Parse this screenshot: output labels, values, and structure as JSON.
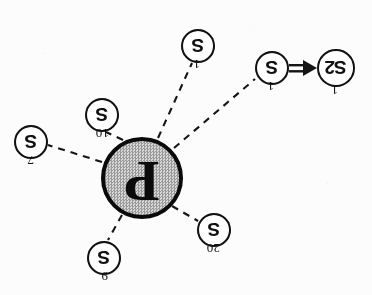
{
  "figure": {
    "orientation_degrees": 180,
    "background_color": "#fcfcfc",
    "ink_color": "#111111",
    "center_fill_color": "#c9c9c9"
  },
  "center_node": {
    "label": "P",
    "name": "center-node-p",
    "x": 230,
    "y": 117,
    "radius": 41
  },
  "nodes": [
    {
      "id": "s-20",
      "label": "S",
      "tag": "20",
      "x": 158,
      "y": 65,
      "radius": 17,
      "tag_dx": -6,
      "tag_dy": -26
    },
    {
      "id": "s-9",
      "label": "S",
      "tag": "9",
      "x": 268,
      "y": 37,
      "radius": 17,
      "tag_dx": -4,
      "tag_dy": -26
    },
    {
      "id": "s-7",
      "label": "S",
      "tag": "7",
      "x": 341,
      "y": 153,
      "radius": 17,
      "tag_dx": -3,
      "tag_dy": -26
    },
    {
      "id": "s-10",
      "label": "S",
      "tag": "10",
      "x": 270,
      "y": 180,
      "radius": 17,
      "tag_dx": -7,
      "tag_dy": -26
    },
    {
      "id": "s-1-bottom",
      "label": "S",
      "tag": "1",
      "x": 174,
      "y": 249,
      "radius": 17,
      "tag_dx": -2,
      "tag_dy": -26
    },
    {
      "id": "s-1-left",
      "label": "S",
      "tag": "1",
      "x": 100,
      "y": 227,
      "radius": 17,
      "tag_dx": -2,
      "tag_dy": -26
    }
  ],
  "terminal_node": {
    "id": "s2-1",
    "label": "S2",
    "tag": "1",
    "x": 36,
    "y": 227,
    "radius": 19,
    "tag_dx": -2,
    "tag_dy": -28
  },
  "dashed_edges": [
    {
      "from": "center-node-p",
      "to": "s-20"
    },
    {
      "from": "center-node-p",
      "to": "s-9"
    },
    {
      "from": "center-node-p",
      "to": "s-7"
    },
    {
      "from": "center-node-p",
      "to": "s-10"
    },
    {
      "from": "center-node-p",
      "to": "s-1-bottom"
    },
    {
      "from": "center-node-p",
      "to": "s-1-left"
    }
  ],
  "arrow_edge": {
    "from": "s-1-left",
    "to": "s2-1",
    "style": "solid-double-line-with-arrowhead",
    "direction": "left"
  }
}
